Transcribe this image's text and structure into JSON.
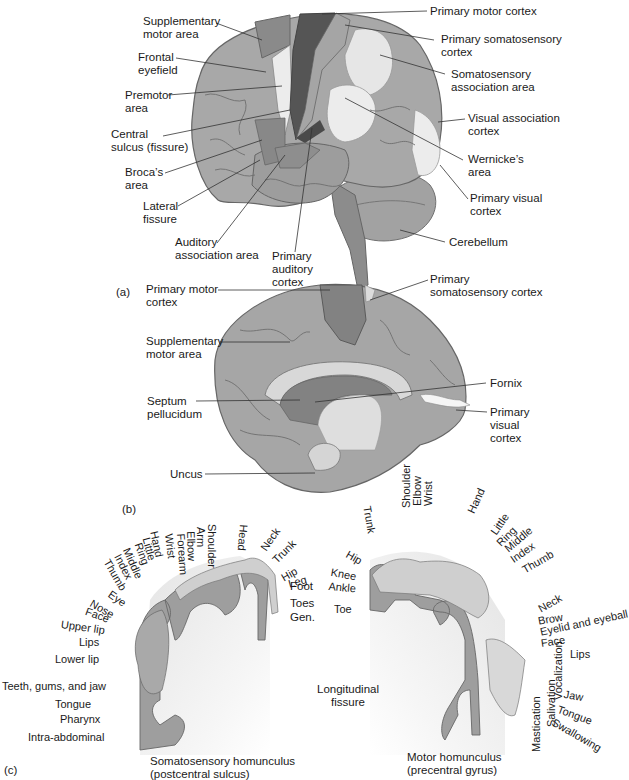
{
  "figure": {
    "colors": {
      "cortex": "#a6a6a6",
      "cortex_dark": "#7c7c7c",
      "motor": "#555555",
      "light_region": "#e8e8e8",
      "outline": "#555555",
      "leader_line": "#333333"
    },
    "panel_a": {
      "tag": "(a)",
      "labels": {
        "supplementary_motor_area": [
          "Supplementary",
          "motor area"
        ],
        "frontal_eyefield": [
          "Frontal",
          "eyefield"
        ],
        "premotor_area": [
          "Premotor",
          "area"
        ],
        "central_sulcus": [
          "Central",
          "sulcus (fissure)"
        ],
        "brocas_area": [
          "Broca’s",
          "area"
        ],
        "lateral_fissure": [
          "Lateral",
          "fissure"
        ],
        "auditory_association_area": [
          "Auditory",
          "association area"
        ],
        "primary_auditory_cortex": [
          "Primary",
          "auditory",
          "cortex"
        ],
        "primary_motor_cortex": [
          "Primary motor cortex"
        ],
        "primary_somatosensory_cortex": [
          "Primary somatosensory",
          "cortex"
        ],
        "somatosensory_association_area": [
          "Somatosensory",
          "association area"
        ],
        "visual_association_cortex": [
          "Visual association",
          "cortex"
        ],
        "wernickes_area": [
          "Wernicke’s",
          "area"
        ],
        "primary_visual_cortex": [
          "Primary visual",
          "cortex"
        ],
        "cerebellum": [
          "Cerebellum"
        ]
      }
    },
    "panel_b": {
      "tag": "(b)",
      "labels": {
        "primary_motor_cortex": [
          "Primary motor",
          "cortex"
        ],
        "supplementary_motor_area": [
          "Supplementary",
          "motor area"
        ],
        "septum_pellucidum": [
          "Septum",
          "pellucidum"
        ],
        "uncus": [
          "Uncus"
        ],
        "primary_somatosensory_cortex": [
          "Primary",
          "somatosensory cortex"
        ],
        "fornix": [
          "Fornix"
        ],
        "primary_visual_cortex": [
          "Primary",
          "visual",
          "cortex"
        ]
      }
    },
    "panel_c": {
      "tag": "(c)",
      "sensory_caption": [
        "Somatosensory homunculus",
        "(postcentral sulcus)"
      ],
      "motor_caption": [
        "Motor homunculus",
        "(precentral gyrus)"
      ],
      "fissure_label": [
        "Longitudinal",
        "fissure"
      ],
      "sensory_arc_labels": [
        "Thumb",
        "Index",
        "Middle",
        "Ring",
        "Little",
        "Hand",
        "Wrist",
        "Forearm",
        "Elbow",
        "Arm",
        "Shoulder",
        "Head",
        "Neck",
        "Trunk",
        "Hip",
        "Leg"
      ],
      "sensory_side_labels": [
        "Foot",
        "Toes",
        "Gen."
      ],
      "sensory_face_labels": [
        "Eye",
        "Nose",
        "Face",
        "Upper lip",
        "Lips",
        "Lower lip",
        "Teeth, gums, and jaw",
        "Tongue",
        "Pharynx",
        "Intra-abdominal"
      ],
      "motor_leg_labels": [
        "Hip",
        "Knee",
        "Ankle",
        "Toe"
      ],
      "motor_arc_labels": [
        "Trunk",
        "Shoulder",
        "Elbow",
        "Wrist",
        "Hand",
        "Little",
        "Ring",
        "Middle",
        "Index",
        "Thumb"
      ],
      "motor_face_labels": [
        "Neck",
        "Brow",
        "Eyelid and eyeball",
        "Face",
        "Lips",
        "Jaw",
        "Tongue",
        "Swallowing"
      ],
      "motor_vertical_labels": [
        "Vocalization",
        "Salivation",
        "Mastication"
      ]
    }
  }
}
